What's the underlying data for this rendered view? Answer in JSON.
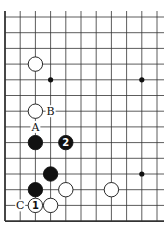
{
  "diagram": {
    "type": "go-board-fragment",
    "grid": {
      "origin_x": 5,
      "origin_y": 17,
      "dx": 15.2,
      "dy": 15.7,
      "cols": 11,
      "rows": 14,
      "extend_right": 7,
      "extend_top": 6,
      "edges": [
        "left",
        "bottom"
      ],
      "line_color": "#333333"
    },
    "star_points": [
      [
        3,
        4
      ],
      [
        9,
        4
      ],
      [
        9,
        10
      ]
    ],
    "stones": [
      {
        "col": 2,
        "row": 3,
        "color": "white",
        "label": ""
      },
      {
        "col": 2,
        "row": 6,
        "color": "white",
        "label": ""
      },
      {
        "col": 2,
        "row": 8,
        "color": "black",
        "label": ""
      },
      {
        "col": 4,
        "row": 8,
        "color": "black",
        "label": "2"
      },
      {
        "col": 3,
        "row": 10,
        "color": "black",
        "label": ""
      },
      {
        "col": 2,
        "row": 11,
        "color": "black",
        "label": ""
      },
      {
        "col": 4,
        "row": 11,
        "color": "white",
        "label": ""
      },
      {
        "col": 7,
        "row": 11,
        "color": "white",
        "label": ""
      },
      {
        "col": 2,
        "row": 12,
        "color": "white",
        "label": "1"
      },
      {
        "col": 3,
        "row": 12,
        "color": "white",
        "label": ""
      }
    ],
    "letters": [
      {
        "col": 3,
        "row": 6,
        "text": "B"
      },
      {
        "col": 2,
        "row": 7,
        "text": "A"
      },
      {
        "col": 1,
        "row": 12,
        "text": "C"
      }
    ]
  }
}
